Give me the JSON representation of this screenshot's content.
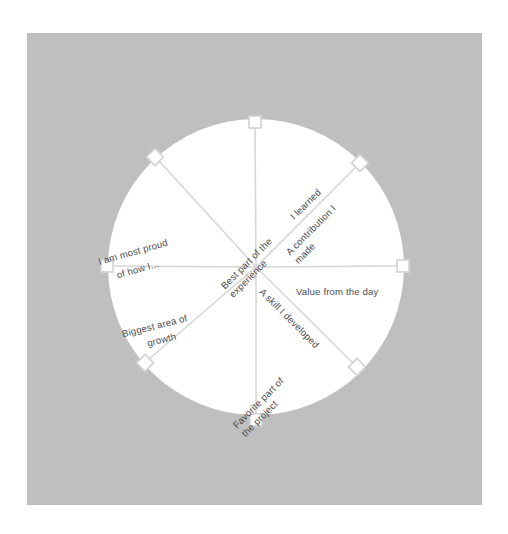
{
  "page": {
    "background_color": "#ffffff"
  },
  "panel": {
    "name": "slide-panel",
    "color": "#bfbfbf",
    "x": 27,
    "y": 33,
    "width": 455,
    "height": 472
  },
  "wheel": {
    "center_x": 256,
    "center_y": 267,
    "radius": 148,
    "disc_color": "#ffffff",
    "spoke_color": "#d6d6d6",
    "node_fill": "#ffffff",
    "node_stroke": "#d4d4d4",
    "node_size": 12,
    "label_color": "#4d4d4d",
    "spoke_count": 8,
    "spokes": [
      {
        "id": "spoke-top",
        "angle_deg": -90,
        "node_shape": "square",
        "node_x": 255,
        "node_y": 122,
        "label": "",
        "label_lines": []
      },
      {
        "id": "spoke-top-right",
        "angle_deg": -45,
        "node_shape": "diamond",
        "node_x": 360,
        "node_y": 163,
        "label": "A contribution I made",
        "label_lines": [
          "A contribution I",
          "made"
        ]
      },
      {
        "id": "spoke-right",
        "angle_deg": 0,
        "node_shape": "square",
        "node_x": 403,
        "node_y": 266,
        "label": "Value from the day",
        "label_lines": [
          "Value from the day"
        ]
      },
      {
        "id": "spoke-bottom-right",
        "angle_deg": 45,
        "node_shape": "diamond",
        "node_x": 357,
        "node_y": 367,
        "label": "A skill I developed",
        "label_lines": [
          "A skill I developed"
        ]
      },
      {
        "id": "spoke-bottom",
        "angle_deg": 90,
        "node_shape": "square",
        "node_x": 256,
        "node_y": 420,
        "label": "",
        "label_lines": []
      },
      {
        "id": "spoke-bottom-left",
        "angle_deg": 135,
        "node_shape": "diamond",
        "node_x": 145,
        "node_y": 363,
        "label": "Favorite part of the project",
        "label_lines": [
          "Favorite part of",
          "the project"
        ]
      },
      {
        "id": "spoke-left",
        "angle_deg": 180,
        "node_shape": "square",
        "node_x": 107,
        "node_y": 266,
        "label": "Biggest area of growth",
        "label_lines": [
          "Biggest area of",
          "growth"
        ]
      },
      {
        "id": "spoke-top-left",
        "angle_deg": -135,
        "node_shape": "diamond",
        "node_x": 155,
        "node_y": 157,
        "label": "I am most proud of how I...",
        "label_lines": [
          "I am most proud",
          "of how I..."
        ]
      }
    ],
    "labels": {
      "best_part": "Best part of the experience",
      "best_part_line1": "Best part of the",
      "best_part_line2": "experience",
      "i_learned": "I learned",
      "contribution_line1": "A contribution I",
      "contribution_line2": "made",
      "value_day": "Value from the day",
      "skill_developed": "A skill I developed",
      "favorite_line1": "Favorite part of",
      "favorite_line2": "the project",
      "biggest_line1": "Biggest area of",
      "biggest_line2": "growth",
      "proud_line1": "I am most proud",
      "proud_line2": "of how I..."
    }
  }
}
